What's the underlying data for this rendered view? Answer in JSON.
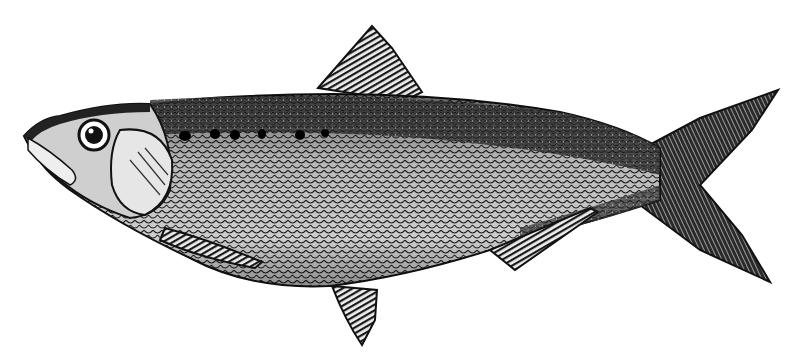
{
  "image": {
    "subject": "fish",
    "style": "black-and-white engraving",
    "background_color": "#ffffff",
    "ink_color": "#111111",
    "caption_fragment": ""
  },
  "parts": {
    "head": "head",
    "eye": "eye",
    "gill_cover": "gill-cover",
    "dorsal_fin": "dorsal-fin",
    "pectoral_fin": "pectoral-fin",
    "pelvic_fin": "pelvic-fin",
    "anal_fin": "anal-fin",
    "caudal_fin": "caudal-fin",
    "lateral_spots": "lateral-spots"
  }
}
